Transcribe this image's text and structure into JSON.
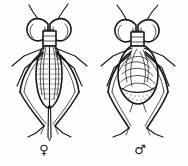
{
  "figure": {
    "kind": "scientific-line-illustration",
    "background_color": "#fefefe",
    "ink_color": "#1a1a1a",
    "specimens": [
      {
        "id": "female",
        "symbol": "♀",
        "symbol_name": "venus-symbol",
        "side": "left",
        "abdomen_shape": "elongate-striped",
        "has_ovipositor": true
      },
      {
        "id": "male",
        "symbol": "♂",
        "symbol_name": "mars-symbol",
        "side": "right",
        "abdomen_shape": "rounded-bulbous",
        "has_ovipositor": false
      }
    ]
  }
}
